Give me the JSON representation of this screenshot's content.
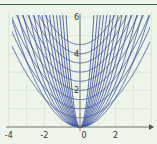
{
  "chart_data": {
    "type": "line",
    "title": "",
    "xlabel": "",
    "ylabel": "",
    "xlim": [
      -4,
      4
    ],
    "ylim": [
      0,
      6
    ],
    "x_ticks": [
      "-4",
      "-2",
      "0",
      "2"
    ],
    "y_ticks": [
      "2",
      "4",
      "6"
    ],
    "grid": true,
    "legend": "none",
    "series": [
      {
        "name": "family y = a·x²",
        "a_values": [
          0.4,
          0.5,
          0.6,
          0.75,
          0.9,
          1.1,
          1.35,
          1.7,
          2.1,
          2.7,
          3.5,
          4.7,
          6.5,
          10
        ]
      },
      {
        "name": "family y = c + b·x²",
        "c_values": [
          0.5,
          1,
          1.5,
          2,
          2.5,
          3,
          3.5,
          4,
          4.5
        ],
        "b": 0.25
      }
    ],
    "line_color": "#34479a"
  },
  "axes": {
    "x_labels": [
      "-4",
      "-2",
      "0",
      "2"
    ],
    "y_labels": [
      "2",
      "4",
      "6"
    ]
  }
}
